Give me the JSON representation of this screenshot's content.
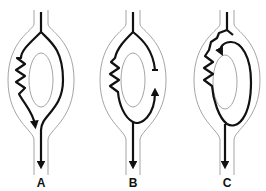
{
  "diagram": {
    "panels": [
      {
        "id": "A",
        "label": "A",
        "center_x": 41
      },
      {
        "id": "B",
        "label": "B",
        "center_x": 133
      },
      {
        "id": "C",
        "label": "C",
        "center_x": 227
      }
    ],
    "colors": {
      "outline": "#9a9a9a",
      "path": "#111111",
      "label": "#111111"
    }
  }
}
